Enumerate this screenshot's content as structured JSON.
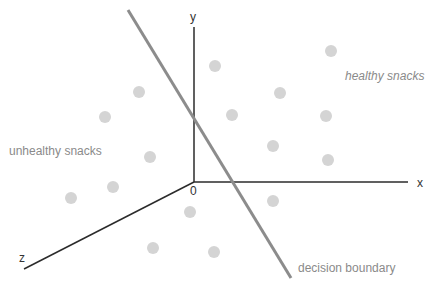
{
  "diagram": {
    "type": "3d-scatter-classification",
    "origin": {
      "x": 194,
      "y": 182
    },
    "axes": [
      {
        "name": "y",
        "label": "y",
        "from": [
          194,
          182
        ],
        "to": [
          194,
          27
        ],
        "label_pos": [
          190,
          11
        ]
      },
      {
        "name": "x",
        "label": "x",
        "from": [
          194,
          182
        ],
        "to": [
          408,
          182
        ],
        "label_pos": [
          417,
          177
        ]
      },
      {
        "name": "z",
        "label": "z",
        "from": [
          194,
          182
        ],
        "to": [
          24,
          269
        ],
        "label_pos": [
          19,
          252
        ]
      }
    ],
    "origin_label": "0",
    "origin_label_pos": [
      190,
      185
    ],
    "decision_boundary": {
      "label": "decision boundary",
      "from": [
        128,
        10
      ],
      "to": [
        291,
        278
      ],
      "label_pos": [
        298,
        262
      ]
    },
    "clusters": [
      {
        "name": "unhealthy",
        "label": "unhealthy snacks",
        "label_pos": [
          9,
          145
        ],
        "italic": false,
        "points": [
          [
            139,
            92
          ],
          [
            105,
            117
          ],
          [
            150,
            157
          ],
          [
            113,
            187
          ],
          [
            71,
            198
          ],
          [
            190,
            212
          ],
          [
            153,
            248
          ],
          [
            214,
            252
          ]
        ]
      },
      {
        "name": "healthy",
        "label": "healthy snacks",
        "label_pos": [
          345,
          70
        ],
        "italic": true,
        "points": [
          [
            331,
            51
          ],
          [
            215,
            66
          ],
          [
            280,
            93
          ],
          [
            232,
            115
          ],
          [
            326,
            116
          ],
          [
            273,
            146
          ],
          [
            328,
            160
          ],
          [
            273,
            201
          ]
        ]
      }
    ],
    "colors": {
      "axis": "#2b2b2b",
      "boundary": "#8c8c8c",
      "point": "#d4d4d4",
      "text": "#8a8a8a",
      "axis_text": "#333333"
    },
    "point_radius": 6
  }
}
